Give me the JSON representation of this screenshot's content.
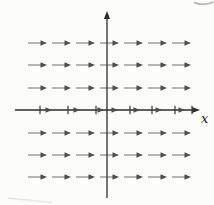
{
  "figure": {
    "x_label": "x",
    "background": "#fcfcfb",
    "axis_color": "#2e2e2e",
    "tick_color": "#3a3a3a",
    "arrow_shaft_color": "#7b7b7b",
    "arrow_head_color": "#4d4d4d",
    "label_color": "#1f1f1f",
    "canvas": {
      "width": 214,
      "height": 205
    },
    "x_axis": {
      "y": 110,
      "x_start": 15,
      "x_end": 192,
      "head_tip_x": 200
    },
    "y_axis": {
      "x": 107,
      "y_start": 18,
      "y_end": 198,
      "head_tip_y": 11
    },
    "field": {
      "description": "direction field of short horizontal arrows all pointing right (slope 0 everywhere)",
      "row_ys": [
        43,
        65,
        88,
        133,
        155,
        177
      ],
      "arrow_head_xs": [
        47,
        71,
        95,
        119,
        143,
        167,
        191
      ],
      "arrow_length": 19
    },
    "axis_row": {
      "y": 110,
      "tick_xs": [
        40,
        68,
        96,
        130,
        152,
        175,
        192
      ],
      "arrow_head_xs": [
        52,
        80,
        104,
        118,
        140,
        162,
        185
      ]
    },
    "artifacts": {
      "top_right_mark": "faint curved print fragment at top-right edge",
      "bottom_left_smudge": "faint diagonal scan smudge at bottom-left"
    }
  }
}
